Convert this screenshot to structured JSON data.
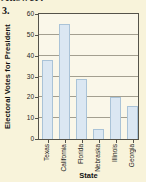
{
  "page": {
    "cutoff_text_top": "Answer:",
    "problem_number": "3."
  },
  "chart_data": {
    "type": "bar",
    "categories": [
      "Texas",
      "California",
      "Florida",
      "Nebraska",
      "Illinois",
      "Georgia"
    ],
    "values": [
      38,
      55,
      29,
      5,
      20,
      16
    ],
    "title": "",
    "xlabel": "State",
    "ylabel": "Electoral Votes for President",
    "ylim": [
      0,
      60
    ],
    "yticks": [
      0,
      10,
      20,
      30,
      40,
      50,
      60
    ],
    "grid": true,
    "legend": false,
    "colors": {
      "bar_fill": "#dbe7f2",
      "bar_border": "#aac3d7",
      "plot_background": "#faf7e9",
      "page_background": "#f8f3da",
      "grid_color": "#a39f90",
      "axis_color": "#55534a"
    }
  }
}
